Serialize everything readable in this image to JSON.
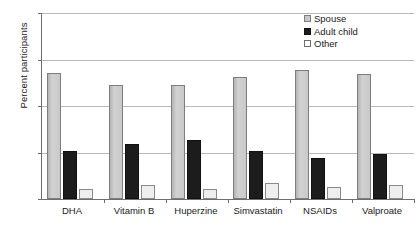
{
  "chart_data": {
    "type": "bar",
    "title": "",
    "xlabel": "",
    "ylabel": "Percent participants",
    "ylim": [
      0,
      100
    ],
    "yticks": [
      0,
      25,
      50,
      75,
      100
    ],
    "ytick_labels": [
      "0",
      "25",
      "50",
      "75",
      "100"
    ],
    "grid": true,
    "legend_position": "top-right",
    "categories": [
      "DHA",
      "Vitamin B",
      "Huperzine",
      "Simvastatin",
      "NSAIDs",
      "Valproate"
    ],
    "series": [
      {
        "name": "Spouse",
        "color": "#c9c9c9",
        "values": [
          67.5,
          61.5,
          61.5,
          65.5,
          69.5,
          67.0
        ]
      },
      {
        "name": "Adult child",
        "color": "#1c1c1c",
        "values": [
          26.0,
          29.5,
          31.5,
          26.0,
          22.0,
          24.0
        ]
      },
      {
        "name": "Other",
        "color": "#ffffff",
        "values": [
          5.5,
          7.5,
          5.5,
          8.5,
          6.5,
          7.5
        ]
      }
    ]
  },
  "legend": {
    "items": [
      {
        "label": "Spouse",
        "swatch": "legend-swatch-spouse"
      },
      {
        "label": "Adult child",
        "swatch": "legend-swatch-adult-child"
      },
      {
        "label": "Other",
        "swatch": "legend-swatch-other"
      }
    ]
  }
}
